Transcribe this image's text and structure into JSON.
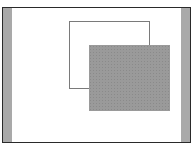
{
  "diagram": {
    "colors": {
      "frame_border": "#2a2a2a",
      "side_strips": "#a9a9a9",
      "outline_rect_border": "#7a7a7a",
      "shaded_rect_fill": "#9a9a9a",
      "background": "#ffffff"
    },
    "shapes": [
      {
        "id": "outline-rect",
        "style": "outline"
      },
      {
        "id": "shaded-rect",
        "style": "stippled-fill",
        "overlaps": "outline-rect"
      }
    ]
  }
}
